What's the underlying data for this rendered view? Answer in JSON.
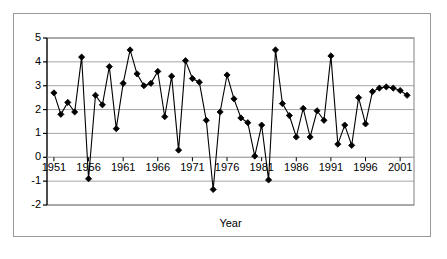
{
  "figure": {
    "background_color": "#ffffff",
    "frame_color": "#9a9a9a",
    "plot_border_color": "#808080",
    "gridline_color": "#a6a6a6",
    "series_color": "#000000"
  },
  "chart_data": {
    "type": "line",
    "title": "",
    "subtitle": "",
    "xlabel": "Year",
    "ylabel": "",
    "xlim": [
      1950,
      2003
    ],
    "ylim": [
      -2,
      5
    ],
    "ytick_labels": [
      "5",
      "4",
      "3",
      "2",
      "1",
      "0",
      "-1",
      "-2"
    ],
    "yticks": [
      5,
      4,
      3,
      2,
      1,
      0,
      -1,
      -2
    ],
    "xtick_labels": [
      "1951",
      "1956",
      "1961",
      "1966",
      "1971",
      "1976",
      "1981",
      "1986",
      "1991",
      "1996",
      "2001"
    ],
    "xticks": [
      1951,
      1956,
      1961,
      1966,
      1971,
      1976,
      1981,
      1986,
      1991,
      1996,
      2001
    ],
    "grid": "horizontal",
    "legend": "none",
    "marker": "diamond",
    "x": [
      1951,
      1952,
      1953,
      1954,
      1955,
      1956,
      1957,
      1958,
      1959,
      1960,
      1961,
      1962,
      1963,
      1964,
      1965,
      1966,
      1967,
      1968,
      1969,
      1970,
      1971,
      1972,
      1973,
      1974,
      1975,
      1976,
      1977,
      1978,
      1979,
      1980,
      1981,
      1982,
      1983,
      1984,
      1985,
      1986,
      1987,
      1988,
      1989,
      1990,
      1991,
      1992,
      1993,
      1994,
      1995,
      1996,
      1997,
      1998,
      1999,
      2000,
      2001,
      2002
    ],
    "values": [
      2.7,
      1.8,
      2.3,
      1.9,
      4.2,
      -0.9,
      2.6,
      2.2,
      3.8,
      1.2,
      3.1,
      4.5,
      3.5,
      3.0,
      3.1,
      3.6,
      1.7,
      3.4,
      0.3,
      4.05,
      3.3,
      3.15,
      1.55,
      -1.35,
      1.9,
      3.45,
      2.45,
      1.65,
      1.45,
      0.05,
      1.35,
      -0.95,
      4.5,
      2.25,
      1.75,
      0.85,
      2.05,
      0.85,
      1.95,
      1.55,
      4.25,
      0.55,
      1.35,
      0.5,
      2.5,
      1.4,
      2.75,
      2.9,
      2.95,
      2.9,
      2.8,
      2.6
    ],
    "values_label": "annual series"
  }
}
